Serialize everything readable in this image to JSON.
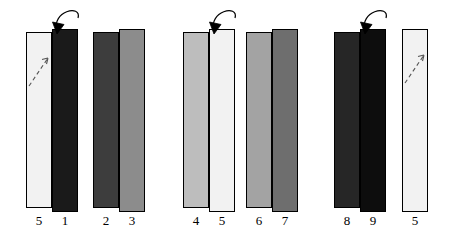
{
  "figure": {
    "title": "",
    "background_color": "#ffffff",
    "outline_color": "#000000",
    "width": 454,
    "height": 245
  },
  "chart_data": {
    "type": "bar",
    "title": "",
    "xlabel": "",
    "ylabel": "",
    "categories": [
      "5",
      "1",
      "2",
      "3",
      "4",
      "5",
      "6",
      "7",
      "8",
      "9",
      "5"
    ],
    "values": [
      1,
      1,
      1,
      1,
      1,
      1,
      1,
      1,
      1,
      1,
      1
    ],
    "grid": false,
    "legend": "none"
  },
  "groups": [
    {
      "id": "group-1",
      "bars": [
        {
          "label": "5",
          "fill": "#f2f2f2",
          "x": 26,
          "y": 32,
          "w": 26,
          "h": 176,
          "label_x": 26,
          "label_y": 214,
          "dashed_arrow": true
        },
        {
          "label": "1",
          "fill": "#1a1a1a",
          "x": 52,
          "y": 29,
          "w": 26,
          "h": 183,
          "label_x": 52,
          "label_y": 214,
          "dashed_arrow": false
        },
        {
          "label": "2",
          "fill": "#3d3d3d",
          "x": 93,
          "y": 32,
          "w": 26,
          "h": 176,
          "label_x": 93,
          "label_y": 214,
          "dashed_arrow": false
        },
        {
          "label": "3",
          "fill": "#8c8c8c",
          "x": 119,
          "y": 29,
          "w": 26,
          "h": 183,
          "label_x": 119,
          "label_y": 214,
          "dashed_arrow": false
        }
      ],
      "arrow": {
        "from_x": 78,
        "from_y": 18,
        "to_x": 57,
        "to_y": 31
      }
    },
    {
      "id": "group-2",
      "bars": [
        {
          "label": "4",
          "fill": "#bdbdbd",
          "x": 183,
          "y": 32,
          "w": 26,
          "h": 176,
          "label_x": 183,
          "label_y": 214,
          "dashed_arrow": false
        },
        {
          "label": "5",
          "fill": "#f2f2f2",
          "x": 209,
          "y": 29,
          "w": 26,
          "h": 183,
          "label_x": 209,
          "label_y": 214,
          "dashed_arrow": false
        },
        {
          "label": "6",
          "fill": "#a3a3a3",
          "x": 246,
          "y": 32,
          "w": 26,
          "h": 176,
          "label_x": 246,
          "label_y": 214,
          "dashed_arrow": false
        },
        {
          "label": "7",
          "fill": "#6e6e6e",
          "x": 272,
          "y": 29,
          "w": 26,
          "h": 183,
          "label_x": 272,
          "label_y": 214,
          "dashed_arrow": false
        }
      ],
      "arrow": {
        "from_x": 235,
        "from_y": 18,
        "to_x": 214,
        "to_y": 31
      }
    },
    {
      "id": "group-3",
      "bars": [
        {
          "label": "8",
          "fill": "#262626",
          "x": 334,
          "y": 32,
          "w": 26,
          "h": 176,
          "label_x": 334,
          "label_y": 214,
          "dashed_arrow": false
        },
        {
          "label": "9",
          "fill": "#0d0d0d",
          "x": 360,
          "y": 29,
          "w": 26,
          "h": 183,
          "label_x": 360,
          "label_y": 214,
          "dashed_arrow": false
        },
        {
          "label": "5",
          "fill": "#f2f2f2",
          "x": 402,
          "y": 29,
          "w": 26,
          "h": 183,
          "label_x": 402,
          "label_y": 214,
          "dashed_arrow": true
        }
      ],
      "arrow": {
        "from_x": 386,
        "from_y": 18,
        "to_x": 365,
        "to_y": 31
      }
    }
  ]
}
